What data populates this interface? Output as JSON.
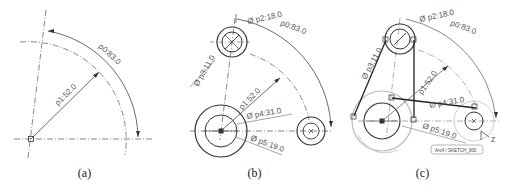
{
  "figure": {
    "panels": [
      {
        "id": "a",
        "caption": "(a)",
        "dimensions": {
          "radius_arc": "ρ0:83.0",
          "radius_line": "ρ1:52.0"
        }
      },
      {
        "id": "b",
        "caption": "(b)",
        "dimensions": {
          "radius_arc": "ρ0:83.0",
          "radius_line": "ρ1:52.0",
          "diam_p2": "Ø p2:18.0",
          "diam_p3": "Ø p3:11.0",
          "diam_p4": "Ø p4:31.0",
          "diam_p5": "Ø p5:19.0"
        }
      },
      {
        "id": "c",
        "caption": "(c)",
        "dimensions": {
          "radius_arc": "ρ0:83.0",
          "radius_line": "ρ1:52.0",
          "diam_p2": "Ø p2:18.0",
          "diam_p3": "Ø p3:11.0",
          "diam_p4": "Ø p4:31.0",
          "diam_p5": "Ø p5:19.0"
        },
        "sketch_tag": "Arc4 / SKETCH_000",
        "axis_label": "Z"
      }
    ],
    "colors": {
      "line": "#333333",
      "dim": "#666666",
      "ghost": "#bbbbbb"
    }
  }
}
